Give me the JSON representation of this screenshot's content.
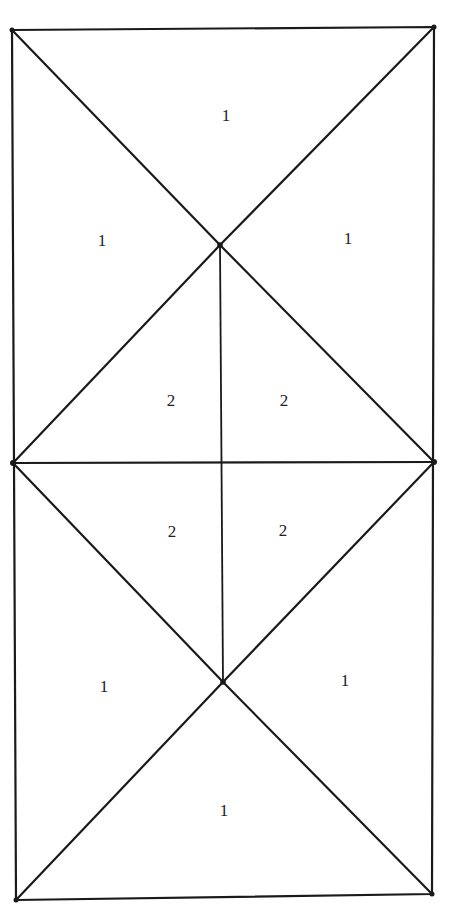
{
  "diagram": {
    "type": "triangulated-rectangle",
    "vertices": {
      "top_left": [
        12,
        30
      ],
      "top_right": [
        434,
        27
      ],
      "upper_center": [
        220,
        245
      ],
      "mid_left": [
        13,
        463
      ],
      "mid_center": [
        222,
        463
      ],
      "mid_right": [
        434,
        462
      ],
      "lower_center": [
        223,
        682
      ],
      "bottom_left": [
        16,
        900
      ],
      "bottom_right": [
        432,
        894
      ]
    },
    "regions": [
      {
        "id": "top",
        "label": "1",
        "x": 226,
        "y": 117
      },
      {
        "id": "upper-left",
        "label": "1",
        "x": 102,
        "y": 242
      },
      {
        "id": "upper-right",
        "label": "1",
        "x": 348,
        "y": 240
      },
      {
        "id": "upper-inner-left",
        "label": "2",
        "x": 171,
        "y": 402
      },
      {
        "id": "upper-inner-right",
        "label": "2",
        "x": 284,
        "y": 402
      },
      {
        "id": "lower-inner-left",
        "label": "2",
        "x": 172,
        "y": 533
      },
      {
        "id": "lower-inner-right",
        "label": "2",
        "x": 283,
        "y": 532
      },
      {
        "id": "lower-left",
        "label": "1",
        "x": 104,
        "y": 688
      },
      {
        "id": "lower-right",
        "label": "1",
        "x": 345,
        "y": 682
      },
      {
        "id": "bottom",
        "label": "1",
        "x": 224,
        "y": 812
      }
    ],
    "colors": {
      "line": "#1a1a1a",
      "background": "#ffffff",
      "text": "#222222"
    }
  }
}
